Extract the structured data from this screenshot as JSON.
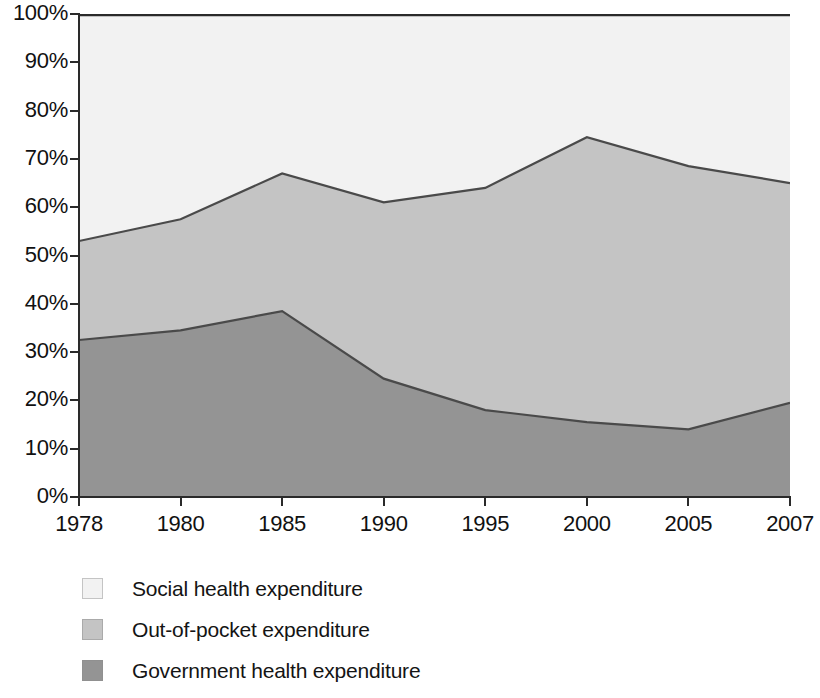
{
  "chart_data": {
    "type": "area",
    "subtype": "stacked-percentage-area",
    "title": "",
    "subtitle": "",
    "xlabel": "",
    "ylabel": "",
    "categories": [
      "1978",
      "1980",
      "1985",
      "1990",
      "1995",
      "2000",
      "2005",
      "2007"
    ],
    "ylim": [
      0,
      100
    ],
    "y_tick_labels": [
      "0%",
      "10%",
      "20%",
      "30%",
      "40%",
      "50%",
      "60%",
      "70%",
      "80%",
      "90%",
      "100%"
    ],
    "y_ticks": [
      0,
      10,
      20,
      30,
      40,
      50,
      60,
      70,
      80,
      90,
      100
    ],
    "grid": false,
    "legend_position": "bottom-left",
    "stack_order_bottom_to_top": [
      "Government health expenditure",
      "Out-of-pocket expenditure",
      "Social health expenditure"
    ],
    "series": [
      {
        "name": "Government health expenditure",
        "color": "#949494",
        "values": [
          32.5,
          34.5,
          38.5,
          24.5,
          18.0,
          15.5,
          14.0,
          19.5
        ]
      },
      {
        "name": "Out-of-pocket expenditure",
        "color": "#c4c4c4",
        "values": [
          20.5,
          23.0,
          28.5,
          36.5,
          46.0,
          59.0,
          54.5,
          45.5
        ]
      },
      {
        "name": "Social health expenditure",
        "color": "#f2f2f2",
        "values": [
          47.0,
          42.5,
          33.0,
          39.0,
          36.0,
          25.5,
          31.5,
          35.0
        ]
      }
    ],
    "cumulative_upper_boundaries": {
      "government_top": [
        32.5,
        34.5,
        38.5,
        24.5,
        18.0,
        15.5,
        14.0,
        19.5
      ],
      "out_of_pocket_top": [
        53.0,
        57.5,
        67.0,
        61.0,
        64.0,
        74.5,
        68.5,
        65.0
      ],
      "social_top": [
        100,
        100,
        100,
        100,
        100,
        100,
        100,
        100
      ]
    }
  },
  "legend": {
    "items": [
      {
        "label": "Social health expenditure",
        "color": "#f2f2f2"
      },
      {
        "label": "Out-of-pocket expenditure",
        "color": "#c4c4c4"
      },
      {
        "label": "Government health expenditure",
        "color": "#949494"
      }
    ]
  },
  "axes": {
    "y_labels": [
      "100%",
      "90%",
      "80%",
      "70%",
      "60%",
      "50%",
      "40%",
      "30%",
      "20%",
      "10%",
      "0%"
    ],
    "x_labels": [
      "1978",
      "1980",
      "1985",
      "1990",
      "1995",
      "2000",
      "2005",
      "2007"
    ]
  },
  "colors": {
    "social": "#f2f2f2",
    "out_of_pocket": "#c4c4c4",
    "government": "#949494",
    "outline": "#4a4a4a",
    "axis": "#2a2a2a",
    "background": "#ffffff"
  },
  "background_bleed_text": {
    "note": "faint scanned-page bleed-through, illegible",
    "lines_left": [
      "as possible and we expand country readiness. World Bank has",
      "of the sector. However, Chinese domestic spending has been in",
      "more commitments to the health sector. Expenditure accounted",
      "of health care spending and the proportion of out-of-pocket",
      "financing. Under the new scheme the government continues to",
      "share of total expenditure on health services in the country",
      "and the remainder from the general public. In 2007 the govern-",
      "ment increased spending on rural health care and insurance",
      "programmes, with new investment in community clinics and",
      "hospitals. The share of social health expenditure rose steadily",
      "through the late 1990s while out-of-pocket payments peaked",
      "around 2000 before declining again. The overall trend reflects",
      "the gradual restoration of public financing in the health sector."
    ]
  }
}
